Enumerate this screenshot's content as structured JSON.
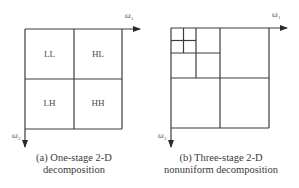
{
  "panels": [
    {
      "id": "a",
      "caption_line1": "(a)  One-stage 2-D",
      "caption_line2": "decomposition",
      "subbands": [
        "LL",
        "HL",
        "LH",
        "HH"
      ],
      "horizontal_axis_label": "ω",
      "horizontal_axis_subscript": "1",
      "vertical_axis_label": "ω",
      "vertical_axis_subscript": "2"
    },
    {
      "id": "b",
      "caption_line1": "(b)  Three-stage 2-D",
      "caption_line2": "nonuniform decomposition",
      "horizontal_axis_label": "ω",
      "horizontal_axis_subscript": "1",
      "vertical_axis_label": "ω",
      "vertical_axis_subscript": "2"
    }
  ],
  "colors": {
    "line": "#3c3c3c",
    "text": "#3a3a3a"
  }
}
